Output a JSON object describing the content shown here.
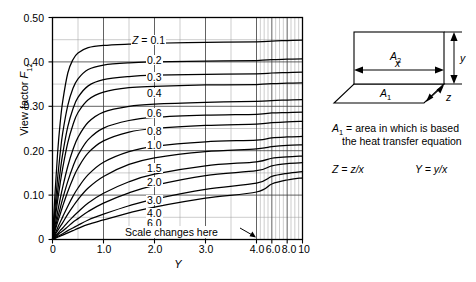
{
  "chart_data": {
    "type": "line",
    "title": "",
    "xlabel": "Y",
    "ylabel": "View factor F12",
    "ylim": [
      0,
      0.5
    ],
    "xlim": [
      0,
      10
    ],
    "grid": true,
    "legend_position": "inline-curve-labels",
    "x_axis_note": "Scale changes here",
    "x_scale_break_at": 4.0,
    "y_ticks": [
      "0",
      "0.10",
      "0.20",
      "0.30",
      "0.40",
      "0.50"
    ],
    "y_tick_values": [
      0,
      0.1,
      0.2,
      0.3,
      0.4,
      0.5
    ],
    "y_minor_step": 0.05,
    "x_ticks": [
      "0",
      "1.0",
      "2.0",
      "3.0",
      "4.0",
      "6.0",
      "8.0",
      "10"
    ],
    "x_tick_values": [
      0,
      1,
      2,
      3,
      4,
      6,
      8,
      10
    ],
    "x_minor_linear_step": 0.5,
    "series_parameter": "Z",
    "series_lead_label": "Z = 0.1",
    "series": [
      {
        "name": "0.1",
        "x": [
          0,
          0.05,
          0.1,
          0.15,
          0.2,
          0.3,
          0.4,
          0.5,
          0.7,
          1.0,
          1.5,
          2.0,
          3.0,
          4.0,
          6.0,
          8.0,
          10
        ],
        "values": [
          0,
          0.105,
          0.195,
          0.262,
          0.311,
          0.375,
          0.405,
          0.42,
          0.432,
          0.437,
          0.44,
          0.442,
          0.444,
          0.445,
          0.447,
          0.448,
          0.449
        ]
      },
      {
        "name": "0.2",
        "x": [
          0,
          0.05,
          0.1,
          0.15,
          0.2,
          0.3,
          0.4,
          0.5,
          0.7,
          1.0,
          1.5,
          2.0,
          3.0,
          4.0,
          6.0,
          8.0,
          10
        ],
        "values": [
          0,
          0.072,
          0.138,
          0.194,
          0.24,
          0.302,
          0.34,
          0.362,
          0.383,
          0.393,
          0.398,
          0.4,
          0.402,
          0.403,
          0.405,
          0.406,
          0.407
        ]
      },
      {
        "name": "0.3",
        "x": [
          0,
          0.05,
          0.1,
          0.15,
          0.2,
          0.3,
          0.4,
          0.5,
          0.7,
          1.0,
          1.5,
          2.0,
          3.0,
          4.0,
          6.0,
          8.0,
          10
        ],
        "values": [
          0,
          0.055,
          0.107,
          0.153,
          0.193,
          0.254,
          0.294,
          0.32,
          0.346,
          0.36,
          0.367,
          0.37,
          0.372,
          0.373,
          0.375,
          0.376,
          0.377
        ]
      },
      {
        "name": "0.4",
        "x": [
          0,
          0.05,
          0.1,
          0.15,
          0.2,
          0.3,
          0.4,
          0.5,
          0.7,
          1.0,
          1.5,
          2.0,
          3.0,
          4.0,
          6.0,
          8.0,
          10
        ],
        "values": [
          0,
          0.045,
          0.087,
          0.126,
          0.161,
          0.218,
          0.258,
          0.286,
          0.315,
          0.332,
          0.342,
          0.345,
          0.348,
          0.349,
          0.351,
          0.352,
          0.353
        ]
      },
      {
        "name": "0.6",
        "x": [
          0,
          0.05,
          0.1,
          0.15,
          0.2,
          0.3,
          0.4,
          0.5,
          0.7,
          1.0,
          1.5,
          2.0,
          3.0,
          4.0,
          6.0,
          8.0,
          10
        ],
        "values": [
          0,
          0.032,
          0.062,
          0.091,
          0.118,
          0.165,
          0.202,
          0.23,
          0.264,
          0.287,
          0.3,
          0.305,
          0.309,
          0.311,
          0.313,
          0.314,
          0.315
        ]
      },
      {
        "name": "0.8",
        "x": [
          0,
          0.05,
          0.1,
          0.15,
          0.2,
          0.3,
          0.4,
          0.5,
          0.7,
          1.0,
          1.5,
          2.0,
          3.0,
          4.0,
          6.0,
          8.0,
          10
        ],
        "values": [
          0,
          0.024,
          0.048,
          0.07,
          0.092,
          0.131,
          0.164,
          0.19,
          0.225,
          0.251,
          0.268,
          0.275,
          0.28,
          0.282,
          0.285,
          0.286,
          0.287
        ]
      },
      {
        "name": "1.0",
        "x": [
          0,
          0.05,
          0.1,
          0.15,
          0.2,
          0.3,
          0.4,
          0.5,
          0.7,
          1.0,
          1.5,
          2.0,
          3.0,
          4.0,
          6.0,
          8.0,
          10
        ],
        "values": [
          0,
          0.02,
          0.039,
          0.057,
          0.075,
          0.108,
          0.137,
          0.161,
          0.195,
          0.222,
          0.242,
          0.25,
          0.257,
          0.26,
          0.263,
          0.265,
          0.266
        ]
      },
      {
        "name": "1.5",
        "x": [
          0,
          0.05,
          0.1,
          0.15,
          0.2,
          0.3,
          0.4,
          0.5,
          0.7,
          1.0,
          1.5,
          2.0,
          3.0,
          4.0,
          6.0,
          8.0,
          10
        ],
        "values": [
          0,
          0.013,
          0.026,
          0.039,
          0.051,
          0.075,
          0.097,
          0.116,
          0.146,
          0.174,
          0.198,
          0.21,
          0.22,
          0.224,
          0.229,
          0.231,
          0.232
        ]
      },
      {
        "name": "2.0",
        "x": [
          0,
          0.05,
          0.1,
          0.15,
          0.2,
          0.3,
          0.4,
          0.5,
          0.7,
          1.0,
          1.5,
          2.0,
          3.0,
          4.0,
          6.0,
          8.0,
          10
        ],
        "values": [
          0,
          0.01,
          0.02,
          0.029,
          0.038,
          0.057,
          0.074,
          0.09,
          0.116,
          0.142,
          0.169,
          0.184,
          0.198,
          0.204,
          0.209,
          0.212,
          0.213
        ]
      },
      {
        "name": "3.0",
        "x": [
          0,
          0.05,
          0.1,
          0.15,
          0.2,
          0.3,
          0.4,
          0.5,
          0.7,
          1.0,
          1.5,
          2.0,
          3.0,
          4.0,
          6.0,
          8.0,
          10
        ],
        "values": [
          0,
          0.007,
          0.013,
          0.02,
          0.026,
          0.039,
          0.051,
          0.062,
          0.082,
          0.104,
          0.13,
          0.147,
          0.166,
          0.175,
          0.183,
          0.186,
          0.188
        ]
      },
      {
        "name": "4.0",
        "x": [
          0,
          0.05,
          0.1,
          0.15,
          0.2,
          0.3,
          0.4,
          0.5,
          0.7,
          1.0,
          1.5,
          2.0,
          3.0,
          4.0,
          6.0,
          8.0,
          10
        ],
        "values": [
          0,
          0.005,
          0.01,
          0.015,
          0.019,
          0.029,
          0.039,
          0.047,
          0.063,
          0.082,
          0.105,
          0.122,
          0.144,
          0.155,
          0.166,
          0.171,
          0.173
        ]
      },
      {
        "name": "6.0",
        "x": [
          0,
          0.05,
          0.1,
          0.15,
          0.2,
          0.3,
          0.4,
          0.5,
          0.7,
          1.0,
          1.5,
          2.0,
          3.0,
          4.0,
          6.0,
          8.0,
          10
        ],
        "values": [
          0,
          0.0035,
          0.007,
          0.01,
          0.013,
          0.02,
          0.026,
          0.032,
          0.044,
          0.057,
          0.076,
          0.091,
          0.113,
          0.127,
          0.142,
          0.149,
          0.153
        ]
      },
      {
        "name": "8.0",
        "x": [
          0,
          0.05,
          0.1,
          0.15,
          0.2,
          0.3,
          0.4,
          0.5,
          0.7,
          1.0,
          1.5,
          2.0,
          3.0,
          4.0,
          6.0,
          8.0,
          10
        ],
        "values": [
          0,
          0.0026,
          0.005,
          0.0077,
          0.01,
          0.015,
          0.02,
          0.025,
          0.034,
          0.044,
          0.06,
          0.073,
          0.093,
          0.107,
          0.125,
          0.134,
          0.139
        ]
      }
    ]
  },
  "chart": {
    "ylabel_pre": "View factor ",
    "ylabel_sym": "F",
    "ylabel_sub": "12",
    "xlabel": "Y",
    "y_ticks": [
      "0.50",
      "0.40",
      "0.30",
      "0.20",
      "0.10",
      "0"
    ],
    "x_ticks": [
      "0",
      "1.0",
      "2.0",
      "3.0",
      "4.0",
      "6.0",
      "8.0",
      "10"
    ],
    "scale_note": "Scale changes here",
    "lead_label_sym": "Z",
    "lead_label_rest": " = 0.1",
    "curve_labels": [
      "0.2",
      "0.3",
      "0.4",
      "0.6",
      "0.8",
      "1.0",
      "1.5",
      "2.0",
      "3.0",
      "4.0",
      "6.0",
      "8.0"
    ]
  },
  "diagram": {
    "area2": "A",
    "area2_sub": "2",
    "area1": "A",
    "area1_sub": "1",
    "dim_x": "x",
    "dim_y": "y",
    "dim_z": "z",
    "note_sym": "A",
    "note_sub": "1",
    "note_line1": " = area in which is based",
    "note_line2": "the heat transfer equation",
    "def_z_sym": "Z",
    "def_z_rest": " = z/x",
    "def_y_sym": "Y",
    "def_y_rest": " = y/x"
  }
}
